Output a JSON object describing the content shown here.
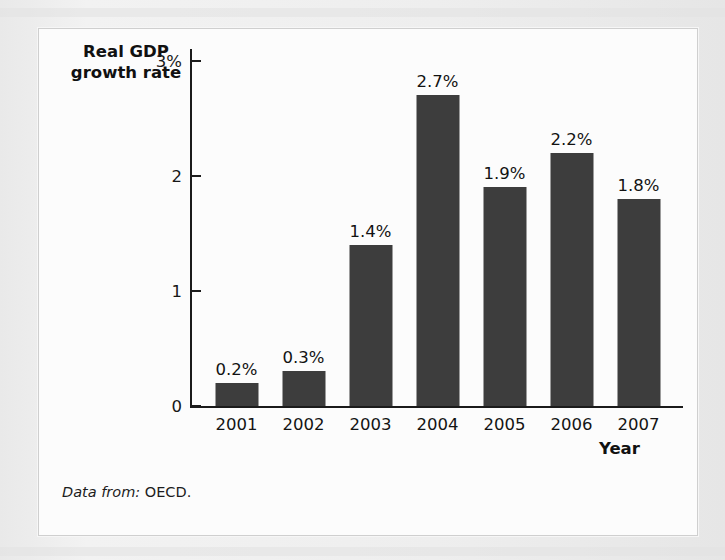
{
  "figure": {
    "source_note_lead": "Data from:",
    "source_note_value": "OECD.",
    "border_color": "#cfcfcf",
    "panel_color": "#fcfcfc"
  },
  "chart_data": {
    "type": "bar",
    "title": "",
    "xlabel": "Year",
    "ylabel": "Real GDP growth rate",
    "ylabel_line1": "Real GDP",
    "ylabel_line2": "growth rate",
    "categories": [
      "2001",
      "2002",
      "2003",
      "2004",
      "2005",
      "2006",
      "2007"
    ],
    "values": [
      0.2,
      0.3,
      1.4,
      2.7,
      1.9,
      2.2,
      1.8
    ],
    "data_labels": [
      "0.2%",
      "0.3%",
      "1.4%",
      "2.7%",
      "1.9%",
      "2.2%",
      "1.8%"
    ],
    "ylim": [
      0,
      3.1
    ],
    "yticks": [
      0,
      1,
      2,
      3
    ],
    "ytick_labels": [
      "0",
      "1",
      "2",
      "3%"
    ],
    "grid": false,
    "legend": "none",
    "bar_color": "#3d3d3d",
    "axis_color": "#1b1b1b",
    "units": "percent"
  }
}
